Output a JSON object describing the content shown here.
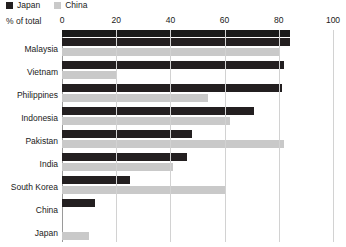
{
  "legend": {
    "items": [
      {
        "label": "Japan",
        "color": "#231f20",
        "icon": "square-swatch-icon"
      },
      {
        "label": "China",
        "color": "#c9c9c9",
        "icon": "square-swatch-icon"
      }
    ]
  },
  "axis": {
    "title": "% of total",
    "ticks": [
      "0",
      "20",
      "40",
      "60",
      "80",
      "100"
    ]
  },
  "chart_data": {
    "type": "bar",
    "orientation": "horizontal",
    "title": "",
    "subtitle": "",
    "xlabel": "% of total",
    "ylabel": "",
    "xlim": [
      0,
      100
    ],
    "xticks": [
      0,
      20,
      40,
      60,
      80,
      100
    ],
    "grid": true,
    "legend_position": "top-left",
    "categories": [
      "Malaysia",
      "Vietnam",
      "Philippines",
      "Indonesia",
      "Pakistan",
      "India",
      "South Korea",
      "China",
      "Japan"
    ],
    "series": [
      {
        "name": "Japan",
        "color": "#231f20",
        "values": [
          84,
          82,
          81,
          71,
          48,
          46,
          25,
          12,
          0
        ]
      },
      {
        "name": "China",
        "color": "#c9c9c9",
        "values": [
          80,
          20,
          54,
          62,
          82,
          41,
          60,
          0,
          10
        ]
      }
    ]
  }
}
